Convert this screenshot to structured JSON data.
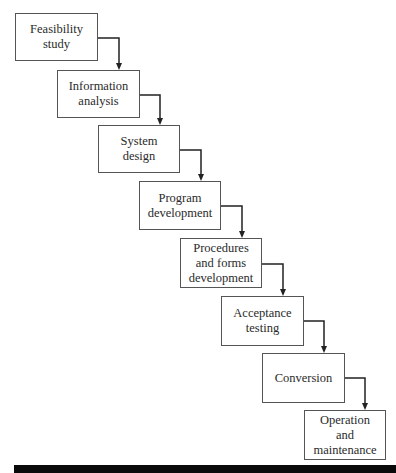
{
  "diagram": {
    "type": "waterfall",
    "steps": [
      {
        "label": "Feasibility\nstudy",
        "x": 15,
        "y": 13,
        "w": 83,
        "h": 48
      },
      {
        "label": "Information\nanalysis",
        "x": 57,
        "y": 70,
        "w": 83,
        "h": 48
      },
      {
        "label": "System\ndesign",
        "x": 98,
        "y": 125,
        "w": 82,
        "h": 48
      },
      {
        "label": "Program\ndevelopment",
        "x": 139,
        "y": 181,
        "w": 82,
        "h": 49
      },
      {
        "label": "Procedures\nand forms\ndevelopment",
        "x": 180,
        "y": 238,
        "w": 82,
        "h": 50
      },
      {
        "label": "Acceptance\ntesting",
        "x": 221,
        "y": 296,
        "w": 83,
        "h": 50
      },
      {
        "label": "Conversion",
        "x": 262,
        "y": 353,
        "w": 83,
        "h": 50
      },
      {
        "label": "Operation\nand\nmaintenance",
        "x": 304,
        "y": 410,
        "w": 82,
        "h": 50
      }
    ],
    "colors": {
      "border": "#555555",
      "arrow": "#222222",
      "bar": "#0a0a0a"
    }
  }
}
